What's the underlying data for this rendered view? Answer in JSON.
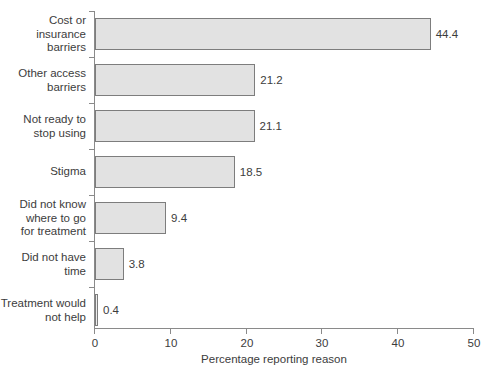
{
  "chart_data": {
    "type": "bar",
    "orientation": "horizontal",
    "title": "",
    "xlabel": "Percentage reporting reason",
    "ylabel": "",
    "xlim": [
      0,
      50
    ],
    "xticks": [
      "0",
      "10",
      "20",
      "30",
      "40",
      "50"
    ],
    "grid": false,
    "legend": null,
    "bar_fill_color": "#e2e2e2",
    "bar_border_color": "#7d7d7d",
    "axis_color": "#8a8a8a",
    "text_color": "#3c3c3c",
    "background_color": "#ffffff",
    "categories": [
      "Cost or insurance\nbarriers",
      "Other access\nbarriers",
      "Not ready to\nstop using",
      "Stigma",
      "Did not know\nwhere to go\nfor treatment",
      "Did not have\ntime",
      "Treatment would\nnot help"
    ],
    "values": [
      44.4,
      21.2,
      21.1,
      18.5,
      9.4,
      3.8,
      0.4
    ],
    "value_labels": [
      "44.4",
      "21.2",
      "21.1",
      "18.5",
      "9.4",
      "3.8",
      "0.4"
    ]
  }
}
